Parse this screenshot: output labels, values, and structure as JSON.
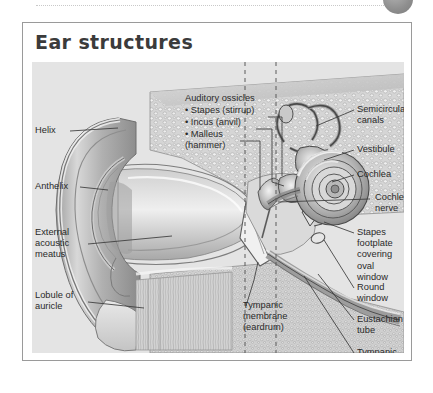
{
  "page": {
    "title": "Ear structures",
    "background_color": "#ffffff",
    "figure_background_color": "#e4e4e4",
    "border_color": "#9a9a9a",
    "text_color": "#2a2a2a"
  },
  "decor": {
    "top_rule": "dotted-rule",
    "corner_badge": "gray-circle-badge"
  },
  "section_headers": [
    {
      "label": "External ear",
      "x": 14,
      "y": 57
    },
    {
      "label": "Middle ear",
      "x": 162,
      "y": 57
    },
    {
      "label": "Inner ear",
      "x": 258,
      "y": 57
    }
  ],
  "labels_left": [
    {
      "name": "helix",
      "text": "Helix",
      "x": 12,
      "y": 104
    },
    {
      "name": "anthelix",
      "text": "Anthelix",
      "x": 12,
      "y": 160
    },
    {
      "name": "external-acoustic-meatus",
      "text": "External\nacoustic\nmeatus",
      "x": 12,
      "y": 196
    },
    {
      "name": "lobule-of-auricle",
      "text": "Lobule of\nauricle",
      "x": 12,
      "y": 258
    }
  ],
  "labels_center": [
    {
      "name": "auditory-ossicles-heading",
      "text": "Auditory ossicles",
      "x": 162,
      "y": 76
    },
    {
      "name": "stapes",
      "text": "• Stapes (stirrup)",
      "x": 162,
      "y": 88
    },
    {
      "name": "incus",
      "text": "• Incus (anvil)",
      "x": 162,
      "y": 100
    },
    {
      "name": "malleus",
      "text": "• Malleus\n  (hammer)",
      "x": 162,
      "y": 112
    },
    {
      "name": "tympanic-membrane",
      "text": "Tympanic\nmembrane\n(eardrum)",
      "x": 218,
      "y": 272
    }
  ],
  "labels_right": [
    {
      "name": "semicircular-canals",
      "text": "Semicircular\ncanals",
      "x": 334,
      "y": 80
    },
    {
      "name": "vestibule",
      "text": "Vestibule",
      "x": 334,
      "y": 120
    },
    {
      "name": "cochlea",
      "text": "Cochlea",
      "x": 334,
      "y": 145
    },
    {
      "name": "cochlear-nerve",
      "text": "Cochlear\nnerve",
      "x": 352,
      "y": 168
    },
    {
      "name": "stapes-footplate",
      "text": "Stapes\nfootplate\ncovering oval\nwindow",
      "x": 334,
      "y": 203
    },
    {
      "name": "round-window",
      "text": "Round\nwindow",
      "x": 334,
      "y": 258
    },
    {
      "name": "eustachian-tube",
      "text": "Eustachian\ntube",
      "x": 334,
      "y": 290
    },
    {
      "name": "tympanic-cavity",
      "text": "Tympanic\ncavity",
      "x": 334,
      "y": 323
    }
  ],
  "dividers": [
    {
      "name": "external-middle-divider",
      "x": 222
    },
    {
      "name": "middle-inner-divider",
      "x": 253
    }
  ],
  "anatomy_regions": [
    "auricle-pinna",
    "ear-canal",
    "tympanic-membrane",
    "malleus",
    "incus",
    "stapes",
    "cochlea-spiral",
    "semicircular-canals",
    "vestibule",
    "cochlear-nerve",
    "eustachian-tube",
    "temporal-bone-cancellous"
  ]
}
